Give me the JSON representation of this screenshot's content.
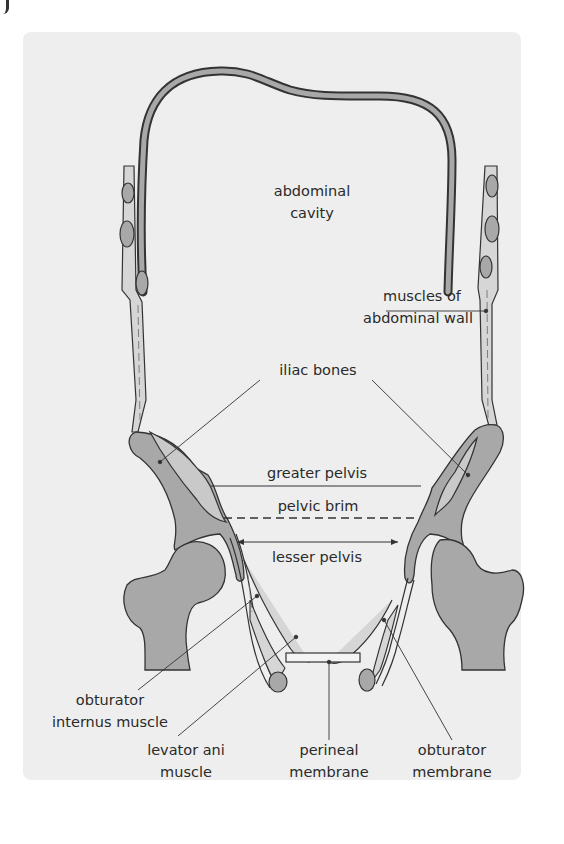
{
  "figure": {
    "labels": {
      "abdominal_cavity": [
        "abdominal",
        "cavity"
      ],
      "muscles_of_abdominal_wall": [
        "muscles of",
        "abdominal wall"
      ],
      "iliac_bones": "iliac bones",
      "greater_pelvis": "greater pelvis",
      "pelvic_brim": "pelvic brim",
      "lesser_pelvis": "lesser pelvis",
      "obturator_internus_muscle": [
        "obturator",
        "internus muscle"
      ],
      "levator_ani_muscle": [
        "levator ani",
        "muscle"
      ],
      "perineal_membrane": [
        "perineal",
        "membrane"
      ],
      "obturator_membrane": [
        "obturator",
        "membrane"
      ]
    },
    "colors": {
      "panel_background": "#eeeeee",
      "bone_dark": "#a8a8a8",
      "bone_light": "#c9c9c9",
      "outline": "#333333",
      "muscle_fill": "#d6d6d6",
      "leader_line": "#333333"
    }
  }
}
